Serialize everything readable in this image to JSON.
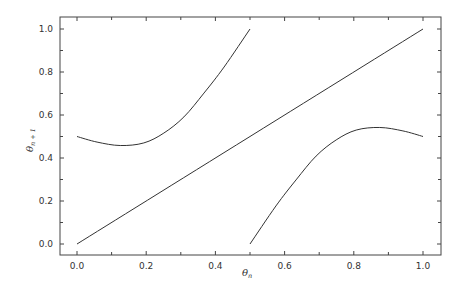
{
  "chart_data": {
    "type": "line",
    "title": "",
    "xlabel": "θ_n",
    "ylabel": "θ_{n+1}",
    "xlim": [
      -0.05,
      1.05
    ],
    "ylim": [
      -0.05,
      1.05
    ],
    "grid": false,
    "legend": null,
    "xticks": [
      0.0,
      0.2,
      0.4,
      0.6,
      0.8,
      1.0
    ],
    "xtick_labels": [
      "0.0",
      "0.2",
      "0.4",
      "0.6",
      "0.8",
      "1.0"
    ],
    "yticks": [
      0.0,
      0.2,
      0.4,
      0.6,
      0.8,
      1.0
    ],
    "ytick_labels": [
      "0.0",
      "0.2",
      "0.4",
      "0.6",
      "0.8",
      "1.0"
    ],
    "series": [
      {
        "name": "map-left-branch",
        "x": [
          0.0,
          0.058,
          0.125,
          0.193,
          0.251,
          0.309,
          0.367,
          0.425,
          0.5
        ],
        "y": [
          0.5,
          0.474,
          0.458,
          0.47,
          0.516,
          0.591,
          0.702,
          0.823,
          1.0
        ]
      },
      {
        "name": "map-right-branch",
        "x": [
          0.5,
          0.575,
          0.633,
          0.691,
          0.749,
          0.807,
          0.875,
          0.942,
          1.0
        ],
        "y": [
          0.0,
          0.177,
          0.298,
          0.409,
          0.484,
          0.53,
          0.542,
          0.526,
          0.5
        ]
      },
      {
        "name": "identity-diagonal",
        "x": [
          0.0,
          1.0
        ],
        "y": [
          0.0,
          1.0
        ]
      }
    ]
  }
}
